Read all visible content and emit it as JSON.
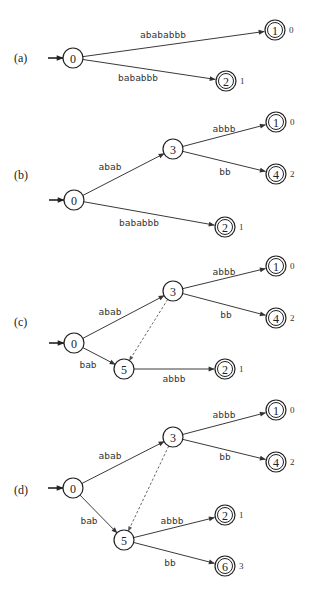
{
  "figure": {
    "node_radius": 10,
    "panels": [
      {
        "label": "(a)",
        "label_pos": [
          14,
          58
        ],
        "start": [
          54,
          58
        ],
        "nodes": [
          {
            "id": "0",
            "x": 73,
            "y": 58,
            "final": false
          },
          {
            "id": "1",
            "x": 275,
            "y": 30,
            "final": true,
            "output": "0"
          },
          {
            "id": "2",
            "x": 226,
            "y": 81,
            "final": true,
            "output": "1"
          }
        ],
        "edges": [
          {
            "from": "0",
            "to": "1",
            "label": "abababbb",
            "lx": 163,
            "ly": 38
          },
          {
            "from": "0",
            "to": "2",
            "label": "bababbb",
            "lx": 138,
            "ly": 81
          }
        ]
      },
      {
        "label": "(b)",
        "label_pos": [
          14,
          175
        ],
        "start": [
          55,
          200
        ],
        "nodes": [
          {
            "id": "0",
            "x": 74,
            "y": 200,
            "final": false
          },
          {
            "id": "3",
            "x": 173,
            "y": 149,
            "final": false
          },
          {
            "id": "1",
            "x": 276,
            "y": 122,
            "final": true,
            "output": "0"
          },
          {
            "id": "4",
            "x": 276,
            "y": 174,
            "final": true,
            "output": "2"
          },
          {
            "id": "2",
            "x": 225,
            "y": 227,
            "final": true,
            "output": "1"
          }
        ],
        "edges": [
          {
            "from": "0",
            "to": "3",
            "label": "abab",
            "lx": 110,
            "ly": 170
          },
          {
            "from": "3",
            "to": "1",
            "label": "abbb",
            "lx": 224,
            "ly": 132
          },
          {
            "from": "3",
            "to": "4",
            "label": "bb",
            "lx": 225,
            "ly": 175
          },
          {
            "from": "0",
            "to": "2",
            "label": "bababbb",
            "lx": 139,
            "ly": 226
          }
        ]
      },
      {
        "label": "(c)",
        "label_pos": [
          14,
          322
        ],
        "start": [
          55,
          343
        ],
        "nodes": [
          {
            "id": "0",
            "x": 74,
            "y": 343,
            "final": false
          },
          {
            "id": "3",
            "x": 173,
            "y": 291,
            "final": false
          },
          {
            "id": "1",
            "x": 276,
            "y": 266,
            "final": true,
            "output": "0"
          },
          {
            "id": "4",
            "x": 276,
            "y": 318,
            "final": true,
            "output": "2"
          },
          {
            "id": "5",
            "x": 124,
            "y": 369,
            "final": false
          },
          {
            "id": "2",
            "x": 225,
            "y": 369,
            "final": true,
            "output": "1"
          }
        ],
        "edges": [
          {
            "from": "0",
            "to": "3",
            "label": "abab",
            "lx": 110,
            "ly": 315
          },
          {
            "from": "3",
            "to": "1",
            "label": "abbb",
            "lx": 224,
            "ly": 275
          },
          {
            "from": "3",
            "to": "4",
            "label": "bb",
            "lx": 226,
            "ly": 318
          },
          {
            "from": "0",
            "to": "5",
            "label": "bab",
            "lx": 88,
            "ly": 368
          },
          {
            "from": "5",
            "to": "2",
            "label": "abbb",
            "lx": 174,
            "ly": 382
          },
          {
            "from": "3",
            "to": "5",
            "label": "",
            "dashed": true
          }
        ]
      },
      {
        "label": "(d)",
        "label_pos": [
          14,
          490
        ],
        "start": [
          54,
          488
        ],
        "nodes": [
          {
            "id": "0",
            "x": 73,
            "y": 488,
            "final": false
          },
          {
            "id": "3",
            "x": 173,
            "y": 437,
            "final": false
          },
          {
            "id": "1",
            "x": 276,
            "y": 410,
            "final": true,
            "output": "0"
          },
          {
            "id": "4",
            "x": 276,
            "y": 462,
            "final": true,
            "output": "2"
          },
          {
            "id": "5",
            "x": 124,
            "y": 540,
            "final": false
          },
          {
            "id": "2",
            "x": 225,
            "y": 515,
            "final": true,
            "output": "1"
          },
          {
            "id": "6",
            "x": 225,
            "y": 566,
            "final": true,
            "output": "3"
          }
        ],
        "edges": [
          {
            "from": "0",
            "to": "3",
            "label": "abab",
            "lx": 110,
            "ly": 459
          },
          {
            "from": "3",
            "to": "1",
            "label": "abbb",
            "lx": 224,
            "ly": 418
          },
          {
            "from": "3",
            "to": "4",
            "label": "bb",
            "lx": 225,
            "ly": 460
          },
          {
            "from": "0",
            "to": "5",
            "label": "bab",
            "lx": 89,
            "ly": 524
          },
          {
            "from": "5",
            "to": "2",
            "label": "abbb",
            "lx": 172,
            "ly": 524
          },
          {
            "from": "5",
            "to": "6",
            "label": "bb",
            "lx": 170,
            "ly": 566
          },
          {
            "from": "3",
            "to": "5",
            "label": "",
            "dashed": true
          }
        ]
      }
    ]
  }
}
